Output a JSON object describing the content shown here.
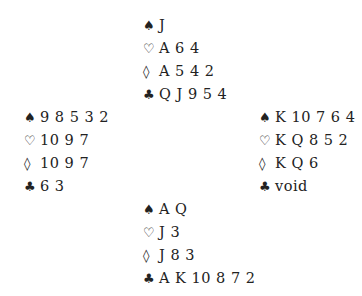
{
  "suits": {
    "spades": "♠",
    "hearts": "♡",
    "diamonds": "◊",
    "clubs": "♣"
  },
  "north": {
    "spades": "J",
    "hearts": "A 6 4",
    "diamonds": "A 5 4 2",
    "clubs": "Q J 9 5 4"
  },
  "west": {
    "spades": "9 8 5 3 2",
    "hearts": "10 9 7",
    "diamonds": "10 9 7",
    "clubs": "6 3"
  },
  "east": {
    "spades": "K 10 7 6 4",
    "hearts": "K Q 8 5 2",
    "diamonds": "K Q 6",
    "clubs": "void"
  },
  "south": {
    "spades": "A Q",
    "hearts": "J 3",
    "diamonds": "J 8 3",
    "clubs": "A K 10 8 7 2"
  }
}
